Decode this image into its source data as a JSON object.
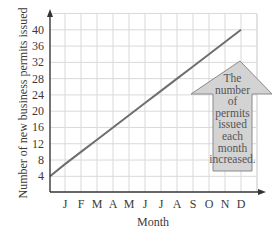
{
  "chart_data": {
    "type": "line",
    "title": "",
    "xlabel": "Month",
    "ylabel": "Number of new business permits issued",
    "categories": [
      "J",
      "F",
      "M",
      "A",
      "M",
      "J",
      "J",
      "A",
      "S",
      "O",
      "N",
      "D"
    ],
    "series": [
      {
        "name": "Permits issued",
        "start": {
          "x": 0,
          "y": 4
        },
        "values": [
          7,
          10,
          13,
          16,
          19,
          22,
          25,
          28,
          31,
          34,
          37,
          40
        ]
      }
    ],
    "yticks": [
      4,
      8,
      12,
      16,
      20,
      24,
      28,
      32,
      36,
      40
    ],
    "ylim": [
      0,
      44
    ],
    "grid": true,
    "annotation": {
      "type": "up-arrow",
      "lines": [
        "The",
        "number",
        "of",
        "permits",
        "issued",
        "each",
        "month",
        "increased."
      ]
    },
    "colors": {
      "line": "#6e6e6e",
      "grid": "#d9d9d9",
      "axis": "#333333",
      "arrow_fill": "#d3d3d3",
      "arrow_stroke": "#8a8a8a"
    }
  }
}
